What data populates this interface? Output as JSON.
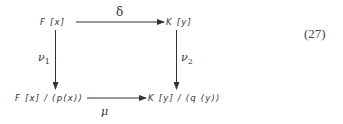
{
  "diagram": {
    "type": "commutative-diagram",
    "nodes": {
      "top_left": "F [x]",
      "top_right": "K [y]",
      "bottom_left": "F [x] / (p(x))",
      "bottom_right": "K [y] / (q (y))"
    },
    "arrows": {
      "top": {
        "from": "top_left",
        "to": "top_right",
        "label": "δ"
      },
      "left": {
        "from": "top_left",
        "to": "bottom_left",
        "label_base": "ν",
        "label_sub": "1"
      },
      "right": {
        "from": "top_right",
        "to": "bottom_right",
        "label_base": "ν",
        "label_sub": "2"
      },
      "bottom": {
        "from": "bottom_left",
        "to": "bottom_right",
        "label": "μ"
      }
    },
    "equation_number": "(27)",
    "colors": {
      "ink": "#333333",
      "background": "#ffffff"
    }
  }
}
